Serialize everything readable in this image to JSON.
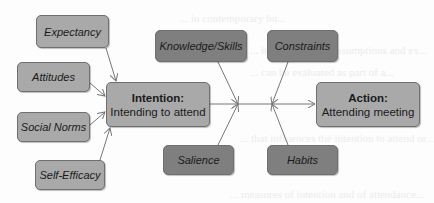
{
  "background_text": [
    "... in contemporary bu...",
    "... its foundational assumptions and ex...",
    "... can be evaluated as part of a...",
    "... that influences the intention to attend or...",
    "... measures of intention and of attendance..."
  ],
  "antecedents": [
    {
      "label": "Expectancy"
    },
    {
      "label": "Attitudes"
    },
    {
      "label": "Social Norms"
    },
    {
      "label": "Self-Efficacy"
    }
  ],
  "intention": {
    "title": "Intention:",
    "subtitle": "Intending to attend"
  },
  "moderators_top": [
    {
      "label": "Knowledge/Skills"
    },
    {
      "label": "Constraints"
    }
  ],
  "moderators_bottom": [
    {
      "label": "Salience"
    },
    {
      "label": "Habits"
    }
  ],
  "action": {
    "title": "Action:",
    "subtitle": "Attending meeting"
  },
  "colors": {
    "antecedent_fill": "#a9a9a9",
    "major_fill": "#a9a9a9",
    "moderator_fill": "#7f7f7f",
    "border": "#6f6f6f",
    "arrow": "#777777"
  }
}
